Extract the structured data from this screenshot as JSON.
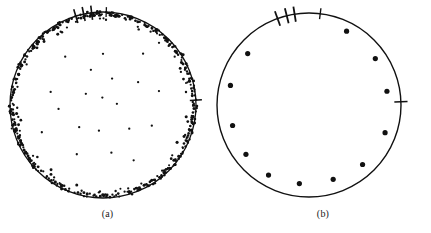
{
  "figure": {
    "type": "two-panel-circular-scatter",
    "background_color": "#ffffff",
    "ink_color": "#111111",
    "width": 431,
    "height": 233
  },
  "panels": [
    {
      "id": "a",
      "caption": "(a)",
      "description": "Circular plot with many points, strongly concentrated near the circumference",
      "circle": {
        "cx": 103,
        "cy": 105,
        "r": 93,
        "stroke_width": 1.3
      },
      "point_radius": 1.15,
      "point_count": 520,
      "ticks": [
        {
          "angle_deg": 107,
          "length": 13,
          "width": 1.6
        },
        {
          "angle_deg": 102,
          "length": 13,
          "width": 1.6
        },
        {
          "angle_deg": 97,
          "length": 13,
          "width": 1.6
        },
        {
          "angle_deg": 88,
          "length": 9,
          "width": 1.3
        },
        {
          "angle_deg": 3,
          "length": 11,
          "width": 1.4
        }
      ]
    },
    {
      "id": "b",
      "caption": "(b)",
      "description": "Circular plot with twelve discrete points spaced near the circumference",
      "circle": {
        "cx": 94,
        "cy": 105,
        "r": 92,
        "stroke_width": 1.4
      },
      "point_radius": 2.6,
      "ticks": [
        {
          "angle_deg": 110,
          "length": 14,
          "width": 1.8
        },
        {
          "angle_deg": 104,
          "length": 14,
          "width": 1.8
        },
        {
          "angle_deg": 99,
          "length": 14,
          "width": 1.8
        },
        {
          "angle_deg": 83,
          "length": 10,
          "width": 1.4
        },
        {
          "angle_deg": 2,
          "length": 12,
          "width": 1.5
        }
      ]
    }
  ],
  "chart_data": [
    {
      "type": "scatter",
      "title": "(a)",
      "coordinate_system": "polar-disc",
      "xlabel": "",
      "ylabel": "",
      "grid": false,
      "legend": null,
      "axis_ticks_deg": [
        107,
        102,
        97,
        88,
        3
      ],
      "radial_range": [
        0,
        1
      ],
      "angular_range_deg": [
        0,
        360
      ],
      "n_points": 520,
      "rim_fraction": 0.72,
      "interior_fraction": 0.28,
      "note": "Dense accumulation of points against the bounding circle with a sparse scattering through the interior",
      "points_polar": [
        {
          "theta": 6,
          "r": 0.99
        },
        {
          "theta": 9,
          "r": 0.97
        },
        {
          "theta": 12,
          "r": 1.0
        },
        {
          "theta": 15,
          "r": 0.94
        },
        {
          "theta": 17,
          "r": 0.99
        },
        {
          "theta": 20,
          "r": 0.98
        },
        {
          "theta": 23,
          "r": 0.91
        },
        {
          "theta": 25,
          "r": 1.0
        },
        {
          "theta": 28,
          "r": 0.96
        },
        {
          "theta": 31,
          "r": 0.99
        },
        {
          "theta": 34,
          "r": 0.93
        },
        {
          "theta": 36,
          "r": 0.98
        },
        {
          "theta": 39,
          "r": 1.0
        },
        {
          "theta": 42,
          "r": 0.95
        },
        {
          "theta": 45,
          "r": 0.99
        },
        {
          "theta": 48,
          "r": 0.9
        },
        {
          "theta": 51,
          "r": 0.97
        },
        {
          "theta": 54,
          "r": 1.0
        },
        {
          "theta": 57,
          "r": 0.94
        },
        {
          "theta": 60,
          "r": 0.98
        },
        {
          "theta": 63,
          "r": 0.99
        },
        {
          "theta": 66,
          "r": 0.92
        },
        {
          "theta": 69,
          "r": 0.97
        },
        {
          "theta": 72,
          "r": 1.0
        },
        {
          "theta": 75,
          "r": 0.95
        },
        {
          "theta": 78,
          "r": 0.99
        },
        {
          "theta": 82,
          "r": 0.96
        },
        {
          "theta": 85,
          "r": 0.98
        },
        {
          "theta": 88,
          "r": 1.0
        },
        {
          "theta": 92,
          "r": 0.93
        },
        {
          "theta": 96,
          "r": 0.99
        },
        {
          "theta": 100,
          "r": 0.97
        },
        {
          "theta": 104,
          "r": 1.0
        },
        {
          "theta": 108,
          "r": 0.94
        },
        {
          "theta": 112,
          "r": 0.98
        },
        {
          "theta": 116,
          "r": 0.99
        },
        {
          "theta": 120,
          "r": 0.91
        },
        {
          "theta": 124,
          "r": 0.97
        },
        {
          "theta": 128,
          "r": 1.0
        },
        {
          "theta": 132,
          "r": 0.95
        },
        {
          "theta": 136,
          "r": 0.99
        },
        {
          "theta": 140,
          "r": 0.96
        },
        {
          "theta": 144,
          "r": 0.98
        },
        {
          "theta": 148,
          "r": 1.0
        },
        {
          "theta": 152,
          "r": 0.93
        },
        {
          "theta": 156,
          "r": 0.99
        },
        {
          "theta": 160,
          "r": 0.97
        },
        {
          "theta": 164,
          "r": 1.0
        },
        {
          "theta": 168,
          "r": 0.94
        },
        {
          "theta": 172,
          "r": 0.98
        },
        {
          "theta": 176,
          "r": 0.99
        },
        {
          "theta": 180,
          "r": 0.96
        },
        {
          "theta": 184,
          "r": 1.0
        },
        {
          "theta": 188,
          "r": 0.92
        },
        {
          "theta": 192,
          "r": 0.98
        },
        {
          "theta": 196,
          "r": 0.99
        },
        {
          "theta": 200,
          "r": 0.95
        },
        {
          "theta": 204,
          "r": 1.0
        },
        {
          "theta": 208,
          "r": 0.97
        },
        {
          "theta": 212,
          "r": 0.99
        },
        {
          "theta": 216,
          "r": 0.93
        },
        {
          "theta": 220,
          "r": 0.98
        },
        {
          "theta": 224,
          "r": 1.0
        },
        {
          "theta": 228,
          "r": 0.96
        },
        {
          "theta": 232,
          "r": 0.99
        },
        {
          "theta": 236,
          "r": 0.94
        },
        {
          "theta": 240,
          "r": 0.98
        },
        {
          "theta": 244,
          "r": 1.0
        },
        {
          "theta": 248,
          "r": 0.97
        },
        {
          "theta": 252,
          "r": 0.99
        },
        {
          "theta": 256,
          "r": 0.95
        },
        {
          "theta": 260,
          "r": 1.0
        },
        {
          "theta": 264,
          "r": 0.98
        },
        {
          "theta": 268,
          "r": 0.93
        },
        {
          "theta": 272,
          "r": 0.99
        },
        {
          "theta": 276,
          "r": 0.97
        },
        {
          "theta": 280,
          "r": 1.0
        },
        {
          "theta": 284,
          "r": 0.96
        },
        {
          "theta": 288,
          "r": 0.98
        },
        {
          "theta": 292,
          "r": 0.99
        },
        {
          "theta": 296,
          "r": 0.94
        },
        {
          "theta": 300,
          "r": 1.0
        },
        {
          "theta": 304,
          "r": 0.97
        },
        {
          "theta": 308,
          "r": 0.99
        },
        {
          "theta": 312,
          "r": 0.95
        },
        {
          "theta": 316,
          "r": 0.98
        },
        {
          "theta": 320,
          "r": 1.0
        },
        {
          "theta": 324,
          "r": 0.92
        },
        {
          "theta": 328,
          "r": 0.99
        },
        {
          "theta": 332,
          "r": 0.97
        },
        {
          "theta": 336,
          "r": 1.0
        },
        {
          "theta": 340,
          "r": 0.94
        },
        {
          "theta": 344,
          "r": 0.98
        },
        {
          "theta": 348,
          "r": 0.99
        },
        {
          "theta": 352,
          "r": 0.96
        },
        {
          "theta": 356,
          "r": 1.0
        },
        {
          "theta": 14,
          "r": 0.62
        },
        {
          "theta": 33,
          "r": 0.45
        },
        {
          "theta": 52,
          "r": 0.7
        },
        {
          "theta": 71,
          "r": 0.3
        },
        {
          "theta": 90,
          "r": 0.55
        },
        {
          "theta": 109,
          "r": 0.4
        },
        {
          "theta": 128,
          "r": 0.66
        },
        {
          "theta": 147,
          "r": 0.22
        },
        {
          "theta": 166,
          "r": 0.58
        },
        {
          "theta": 185,
          "r": 0.48
        },
        {
          "theta": 204,
          "r": 0.72
        },
        {
          "theta": 223,
          "r": 0.35
        },
        {
          "theta": 242,
          "r": 0.6
        },
        {
          "theta": 261,
          "r": 0.28
        },
        {
          "theta": 280,
          "r": 0.52
        },
        {
          "theta": 299,
          "r": 0.68
        },
        {
          "theta": 318,
          "r": 0.38
        },
        {
          "theta": 337,
          "r": 0.57
        },
        {
          "theta": 5,
          "r": 0.15
        },
        {
          "theta": 95,
          "r": 0.08
        }
      ]
    },
    {
      "type": "scatter",
      "title": "(b)",
      "coordinate_system": "polar-disc",
      "xlabel": "",
      "ylabel": "",
      "grid": false,
      "legend": null,
      "axis_ticks_deg": [
        110,
        104,
        99,
        83,
        2
      ],
      "radial_range": [
        0,
        1
      ],
      "angular_range_deg": [
        0,
        360
      ],
      "n_points": 12,
      "note": "Twelve isolated points set just inside the bounding circle at irregular angular spacing",
      "points_polar": [
        {
          "theta": 63,
          "r": 0.9
        },
        {
          "theta": 35,
          "r": 0.88
        },
        {
          "theta": 10,
          "r": 0.86
        },
        {
          "theta": 340,
          "r": 0.88
        },
        {
          "theta": 312,
          "r": 0.87
        },
        {
          "theta": 288,
          "r": 0.85
        },
        {
          "theta": 263,
          "r": 0.86
        },
        {
          "theta": 240,
          "r": 0.88
        },
        {
          "theta": 218,
          "r": 0.87
        },
        {
          "theta": 195,
          "r": 0.86
        },
        {
          "theta": 166,
          "r": 0.88
        },
        {
          "theta": 140,
          "r": 0.87
        }
      ]
    }
  ]
}
